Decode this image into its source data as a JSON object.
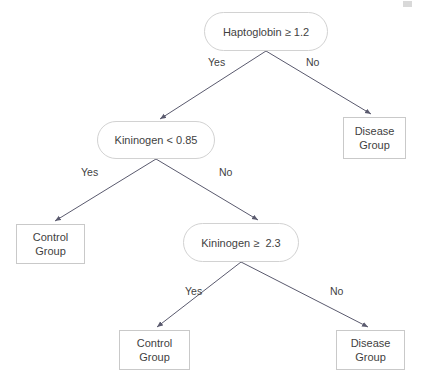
{
  "diagram": {
    "type": "decision-tree",
    "title": "",
    "background_color": "#ffffff",
    "node_border_color": "#d2d2d2",
    "leaf_border_color": "#c9c9c9",
    "edge_color": "#5a5a6e",
    "text_color": "#3f3f3f",
    "nodes": [
      {
        "id": "root",
        "kind": "decision",
        "label": "Haptoglobin ≥ 1.2",
        "x": 204,
        "y": 12,
        "width": 124,
        "height": 39
      },
      {
        "id": "kininogen_low",
        "kind": "decision",
        "label": "Kininogen < 0.85",
        "x": 97,
        "y": 121,
        "width": 118,
        "height": 38
      },
      {
        "id": "disease_right",
        "kind": "leaf",
        "line1": "Disease",
        "line2": "Group",
        "x": 343,
        "y": 117,
        "width": 63,
        "height": 42
      },
      {
        "id": "control_left",
        "kind": "leaf",
        "line1": "Control",
        "line2": "Group",
        "x": 16,
        "y": 224,
        "width": 69,
        "height": 40
      },
      {
        "id": "kininogen_high",
        "kind": "decision",
        "label": "Kininogen ≥  2.3",
        "x": 183,
        "y": 223,
        "width": 116,
        "height": 39
      },
      {
        "id": "control_bottom",
        "kind": "leaf",
        "line1": "Control",
        "line2": "Group",
        "x": 119,
        "y": 330,
        "width": 71,
        "height": 40
      },
      {
        "id": "disease_bottom",
        "kind": "leaf",
        "line1": "Disease",
        "line2": "Group",
        "x": 336,
        "y": 330,
        "width": 69,
        "height": 40
      }
    ],
    "edge_labels": [
      {
        "id": "root-yes",
        "text": "Yes",
        "x": 208,
        "y": 56
      },
      {
        "id": "root-no",
        "text": "No",
        "x": 306,
        "y": 56
      },
      {
        "id": "kininogen-low-yes",
        "text": "Yes",
        "x": 81,
        "y": 166
      },
      {
        "id": "kininogen-low-no",
        "text": "No",
        "x": 219,
        "y": 166
      },
      {
        "id": "kininogen-high-yes",
        "text": "Yes",
        "x": 185,
        "y": 285
      },
      {
        "id": "kininogen-high-no",
        "text": "No",
        "x": 330,
        "y": 285
      }
    ],
    "edges": [
      {
        "id": "root-to-kininogen-low",
        "from": "root",
        "to": "kininogen_low",
        "branch": "Yes",
        "x1": 266,
        "y1": 51,
        "x2": 160,
        "y2": 119
      },
      {
        "id": "root-to-disease-right",
        "from": "root",
        "to": "disease_right",
        "branch": "No",
        "x1": 266,
        "y1": 51,
        "x2": 371,
        "y2": 114
      },
      {
        "id": "kininogen-low-to-control",
        "from": "kininogen_low",
        "to": "control_left",
        "branch": "Yes",
        "x1": 156,
        "y1": 159,
        "x2": 55,
        "y2": 221
      },
      {
        "id": "kininogen-low-to-kininogen-high",
        "from": "kininogen_low",
        "to": "kininogen_high",
        "branch": "No",
        "x1": 156,
        "y1": 159,
        "x2": 258,
        "y2": 220
      },
      {
        "id": "kininogen-high-to-control",
        "from": "kininogen_high",
        "to": "control_bottom",
        "branch": "Yes",
        "x1": 241,
        "y1": 262,
        "x2": 157,
        "y2": 327
      },
      {
        "id": "kininogen-high-to-disease",
        "from": "kininogen_high",
        "to": "disease_bottom",
        "branch": "No",
        "x1": 241,
        "y1": 262,
        "x2": 368,
        "y2": 327
      }
    ]
  }
}
